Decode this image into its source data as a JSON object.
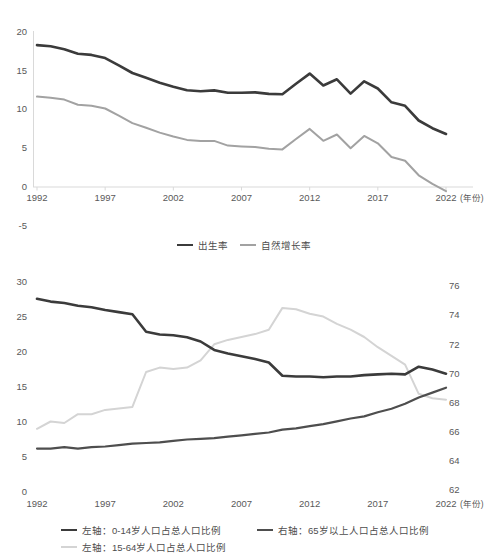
{
  "chart_data": [
    {
      "id": "birth-and-natural-growth-rate",
      "type": "line",
      "x": [
        1992,
        1993,
        1994,
        1995,
        1996,
        1997,
        1998,
        1999,
        2000,
        2001,
        2002,
        2003,
        2004,
        2005,
        2006,
        2007,
        2008,
        2009,
        2010,
        2011,
        2012,
        2013,
        2014,
        2015,
        2016,
        2017,
        2018,
        2019,
        2020,
        2021,
        2022
      ],
      "xticks": [
        1992,
        1997,
        2002,
        2007,
        2012,
        2017,
        2022
      ],
      "x_axis_suffix": "(年份)",
      "ylim": [
        -5,
        20
      ],
      "yticks": [
        -5,
        0,
        5,
        10,
        15,
        20
      ],
      "grid": false,
      "legend_position": "bottom-center",
      "axis_color": "#d9d9d9",
      "tick_label_color": "#595959",
      "series": [
        {
          "name": "出生率",
          "color": "#3b3b3b",
          "line_width": 2.6,
          "plot_axis": "left",
          "values": [
            18.24,
            18.09,
            17.7,
            17.12,
            16.98,
            16.57,
            15.64,
            14.64,
            14.03,
            13.38,
            12.86,
            12.41,
            12.29,
            12.4,
            12.09,
            12.1,
            12.14,
            11.95,
            11.9,
            13.27,
            14.57,
            13.03,
            13.83,
            11.99,
            13.57,
            12.64,
            10.86,
            10.41,
            8.52,
            7.52,
            6.77
          ]
        },
        {
          "name": "自然增长率",
          "color": "#a2a2a2",
          "line_width": 2,
          "plot_axis": "left",
          "values": [
            11.6,
            11.45,
            11.21,
            10.55,
            10.42,
            10.06,
            9.14,
            8.18,
            7.58,
            6.95,
            6.45,
            6.01,
            5.87,
            5.89,
            5.28,
            5.17,
            5.08,
            4.87,
            4.79,
            6.13,
            7.43,
            5.9,
            6.71,
            4.93,
            6.53,
            5.58,
            3.81,
            3.32,
            1.45,
            0.34,
            -0.6
          ]
        }
      ]
    },
    {
      "id": "population-age-structure",
      "type": "line",
      "x": [
        1992,
        1993,
        1994,
        1995,
        1996,
        1997,
        1998,
        1999,
        2000,
        2001,
        2002,
        2003,
        2004,
        2005,
        2006,
        2007,
        2008,
        2009,
        2010,
        2011,
        2012,
        2013,
        2014,
        2015,
        2016,
        2017,
        2018,
        2019,
        2020,
        2021,
        2022
      ],
      "xticks": [
        1992,
        1997,
        2002,
        2007,
        2012,
        2017,
        2022
      ],
      "x_axis_suffix": "(年份)",
      "ylim_left": [
        0,
        30
      ],
      "yticks_left": [
        0,
        5,
        10,
        15,
        20,
        25,
        30
      ],
      "ylim_right": [
        62,
        76
      ],
      "yticks_right": [
        62,
        64,
        66,
        68,
        70,
        72,
        74,
        76
      ],
      "grid": false,
      "legend_position": "bottom-left-two-columns",
      "tick_label_color": "#595959",
      "series": [
        {
          "name": "左轴：0-14岁人口占总人口比例",
          "color": "#3b3b3b",
          "line_width": 2.6,
          "plot_axis": "left",
          "values": [
            27.6,
            27.2,
            27.0,
            26.6,
            26.4,
            26.0,
            25.7,
            25.4,
            22.9,
            22.5,
            22.4,
            22.1,
            21.5,
            20.3,
            19.8,
            19.4,
            19.0,
            18.5,
            16.6,
            16.5,
            16.5,
            16.4,
            16.5,
            16.5,
            16.7,
            16.8,
            16.9,
            16.8,
            17.9,
            17.5,
            16.9
          ]
        },
        {
          "name": "左轴：15-64岁人口占总人口比例",
          "color": "#d4d4d4",
          "line_width": 2,
          "plot_axis": "right",
          "values": [
            66.2,
            66.7,
            66.6,
            67.2,
            67.2,
            67.5,
            67.6,
            67.7,
            70.1,
            70.4,
            70.3,
            70.4,
            70.9,
            72.0,
            72.3,
            72.5,
            72.7,
            73.0,
            74.5,
            74.4,
            74.1,
            73.9,
            73.4,
            73.0,
            72.5,
            71.8,
            71.2,
            70.6,
            68.6,
            68.3,
            68.2
          ]
        },
        {
          "name": "右轴：65岁以上人口占总人口比例",
          "color": "#4e4e4e",
          "line_width": 2.2,
          "plot_axis": "left",
          "values": [
            6.2,
            6.2,
            6.4,
            6.2,
            6.4,
            6.5,
            6.7,
            6.9,
            7.0,
            7.1,
            7.3,
            7.5,
            7.6,
            7.7,
            7.9,
            8.1,
            8.3,
            8.5,
            8.9,
            9.1,
            9.4,
            9.7,
            10.1,
            10.5,
            10.8,
            11.4,
            11.9,
            12.6,
            13.5,
            14.2,
            14.9
          ]
        }
      ]
    }
  ]
}
